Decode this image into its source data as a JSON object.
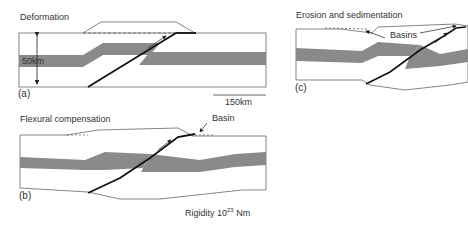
{
  "panels": [
    {
      "id": "a",
      "title": "Deformation",
      "label": "(a)",
      "thickness_label": "50km",
      "scale_label": "150km"
    },
    {
      "id": "b",
      "title": "Flexural compensation",
      "label": "(b)",
      "annotation": "Basin",
      "rigidity_prefix": "Rigidity 10",
      "rigidity_exp": "23",
      "rigidity_unit": " Nm"
    },
    {
      "id": "c",
      "title": "Erosion and sedimentation",
      "label": "(c)",
      "annotation": "Basins"
    }
  ],
  "colors": {
    "band": "#8a8a8a",
    "line": "#555555",
    "fault": "#111111",
    "text": "#333333"
  }
}
